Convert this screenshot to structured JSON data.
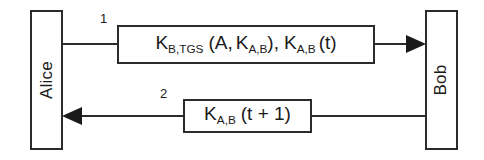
{
  "diagram": {
    "type": "protocol-message-sequence",
    "actors": [
      {
        "id": "alice",
        "label": "Alice",
        "side": "left"
      },
      {
        "id": "bob",
        "label": "Bob",
        "side": "right"
      }
    ],
    "messages": [
      {
        "number": "1",
        "direction": "alice-to-bob",
        "arrow": "right",
        "text_plain": "K_B,TGS (A, K_A,B), K_A,B (t)",
        "parts": {
          "k1": "K",
          "k1_sub": "B,TGS",
          "open_paren": "(A,",
          "k2": "K",
          "k2_sub": "A,B",
          "close_paren": "),",
          "k3": "K",
          "k3_sub": "A,B",
          "tail": "(t)"
        }
      },
      {
        "number": "2",
        "direction": "bob-to-alice",
        "arrow": "left",
        "text_plain": "K_A,B (t + 1)",
        "parts": {
          "k1": "K",
          "k1_sub": "A,B",
          "tail": "(t + 1)"
        }
      }
    ],
    "colors": {
      "stroke": "#2b2b2b",
      "text": "#1a1a1a",
      "background": "#ffffff"
    }
  }
}
